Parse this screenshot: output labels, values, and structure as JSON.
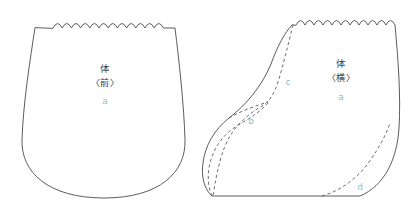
{
  "diagram": {
    "background_color": "#ffffff",
    "outline_color": "#4a4a4a",
    "dash_color": "#555555",
    "text_color": "#3b3b3b",
    "accent_color": "#7fc4c8"
  },
  "pieces": [
    {
      "id": "front",
      "name": "body-front",
      "kanji": "体",
      "view": "〈前〉",
      "letter": "a",
      "letter_color": "#7fc4c8",
      "top_edge": "scalloped",
      "scallop_count": 12
    },
    {
      "id": "side",
      "name": "body-side",
      "kanji": "体",
      "view": "〈横〉",
      "letter": "a",
      "letter_color": "#7fc4c8",
      "top_edge": "scalloped",
      "scallop_count": 12
    }
  ],
  "seam_markers": [
    {
      "id": "b",
      "label": "b",
      "color": "#7fc4c8",
      "piece": "body-side"
    },
    {
      "id": "c",
      "label": "c",
      "color": "#7fc4c8",
      "piece": "body-side"
    },
    {
      "id": "d",
      "label": "d",
      "color": "#7fc4c8",
      "piece": "body-side"
    }
  ]
}
